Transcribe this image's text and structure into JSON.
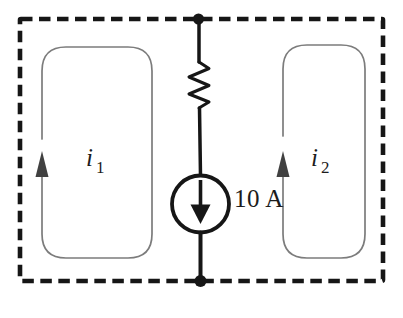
{
  "diagram": {
    "type": "circuit-diagram",
    "labels": {
      "mesh1_base": "i",
      "mesh1_sub": "1",
      "mesh2_base": "i",
      "mesh2_sub": "2",
      "current_source_value": "10 A"
    },
    "colors": {
      "background": "#ffffff",
      "wire": "#161616",
      "loop": "#7c7c7c",
      "loop_arrow": "#414141",
      "text": "#1c1c1c"
    },
    "elements": {
      "outer_boundary": "dashed rectangle",
      "center_branch": [
        "resistor",
        "current source (arrow down)"
      ],
      "mesh1_direction": "clockwise",
      "mesh2_direction": "clockwise",
      "nodes": [
        "top-node",
        "bottom-node"
      ]
    }
  }
}
